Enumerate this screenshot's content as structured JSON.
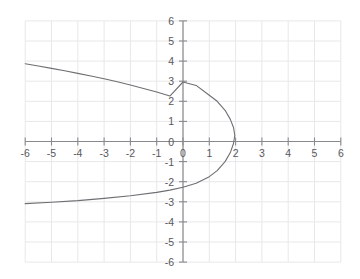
{
  "chart_data": {
    "type": "line",
    "title": "",
    "xlabel": "",
    "ylabel": "",
    "xlim": [
      -6,
      6
    ],
    "ylim": [
      -6,
      6
    ],
    "grid": true,
    "legend": "none",
    "x_ticks": [
      -6,
      -5,
      -4,
      -3,
      -2,
      -1,
      0,
      1,
      2,
      3,
      4,
      5,
      6
    ],
    "y_ticks": [
      -6,
      -5,
      -4,
      -3,
      -2,
      -1,
      0,
      1,
      2,
      3,
      4,
      5,
      6
    ],
    "x_tick_labels": [
      "-6",
      "-5",
      "-4",
      "-3",
      "-2",
      "-1",
      "0",
      "1",
      "2",
      "3",
      "4",
      "5",
      "6"
    ],
    "y_tick_labels": [
      "-6",
      "-5",
      "-4",
      "-3",
      "-2",
      "-1",
      "0",
      "1",
      "2",
      "3",
      "4",
      "5",
      "6"
    ],
    "origin_label": "0",
    "series": [
      {
        "name": "sideways-parabola",
        "description": "Leftward-opening parabola with vertex near (2, 0.3)",
        "points": [
          [
            -6.0,
            3.87
          ],
          [
            -5.5,
            3.76
          ],
          [
            -5.0,
            3.64
          ],
          [
            -4.5,
            3.52
          ],
          [
            -4.0,
            3.39
          ],
          [
            -3.5,
            3.26
          ],
          [
            -3.0,
            3.12
          ],
          [
            -2.5,
            2.97
          ],
          [
            -2.0,
            2.81
          ],
          [
            -1.5,
            2.64
          ],
          [
            -1.0,
            2.46
          ],
          [
            -0.5,
            2.26
          ],
          [
            0.0,
            2.96
          ],
          [
            0.5,
            2.79
          ],
          [
            1.0,
            2.3
          ],
          [
            1.3,
            2.0
          ],
          [
            1.6,
            1.55
          ],
          [
            1.8,
            1.1
          ],
          [
            1.92,
            0.7
          ],
          [
            1.97,
            0.3
          ],
          [
            1.92,
            -0.1
          ],
          [
            1.8,
            -0.55
          ],
          [
            1.6,
            -1.0
          ],
          [
            1.3,
            -1.45
          ],
          [
            1.0,
            -1.75
          ],
          [
            0.5,
            -2.08
          ],
          [
            0.0,
            -2.28
          ],
          [
            -0.5,
            -2.42
          ],
          [
            -1.0,
            -2.53
          ],
          [
            -2.0,
            -2.7
          ],
          [
            -3.0,
            -2.83
          ],
          [
            -4.0,
            -2.94
          ],
          [
            -5.0,
            -3.02
          ],
          [
            -6.0,
            -3.09
          ]
        ]
      }
    ]
  },
  "colors": {
    "grid": "#e8e8ea",
    "axis": "#8a8a8e",
    "curve": "#6f6f73",
    "label": "#58585c",
    "background": "#ffffff"
  }
}
